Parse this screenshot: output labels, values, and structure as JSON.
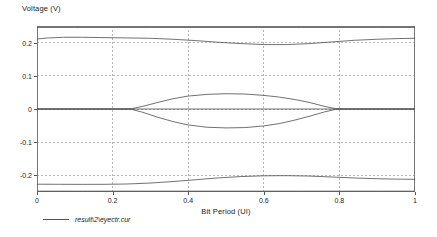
{
  "chart_data": {
    "type": "line",
    "title": "",
    "xlabel": "Bit Period (UI)",
    "ylabel": "Voltage (V)",
    "xlim": [
      0,
      1
    ],
    "ylim": [
      -0.25,
      0.25
    ],
    "x_ticks": [
      "0",
      "0.2",
      "0.4",
      "0.6",
      "0.8",
      "1"
    ],
    "x_tick_values": [
      0,
      0.2,
      0.4,
      0.6,
      0.8,
      1
    ],
    "y_ticks": [
      "0.2",
      "0.1",
      "0",
      "-0.1",
      "-0.2"
    ],
    "y_tick_values": [
      0.2,
      0.1,
      0,
      -0.1,
      -0.2
    ],
    "grid": true,
    "grid_style": "dashed",
    "grid_color": "#999999",
    "border_color": "#777777",
    "trace_color": "#4d4d4d",
    "legend_position": "below-left",
    "legend": [
      "result\\2\\eyectr.cur"
    ],
    "series": [
      {
        "name": "upper-rail-outer",
        "comment": "flat top envelope near +0.245 V",
        "points": [
          [
            0.0,
            0.2455
          ],
          [
            0.1,
            0.2455
          ],
          [
            0.2,
            0.2455
          ],
          [
            0.3,
            0.2455
          ],
          [
            0.4,
            0.2455
          ],
          [
            0.5,
            0.2455
          ],
          [
            0.6,
            0.2455
          ],
          [
            0.7,
            0.2455
          ],
          [
            0.8,
            0.2455
          ],
          [
            0.9,
            0.2455
          ],
          [
            1.0,
            0.2455
          ]
        ]
      },
      {
        "name": "upper-rail-inner",
        "comment": "high level trace dipping slightly below 0.2 mid-period",
        "points": [
          [
            0.0,
            0.211
          ],
          [
            0.03,
            0.214
          ],
          [
            0.07,
            0.216
          ],
          [
            0.12,
            0.216
          ],
          [
            0.18,
            0.215
          ],
          [
            0.24,
            0.214
          ],
          [
            0.3,
            0.213
          ],
          [
            0.36,
            0.21
          ],
          [
            0.42,
            0.206
          ],
          [
            0.48,
            0.201
          ],
          [
            0.54,
            0.197
          ],
          [
            0.6,
            0.194
          ],
          [
            0.66,
            0.194
          ],
          [
            0.72,
            0.197
          ],
          [
            0.78,
            0.202
          ],
          [
            0.84,
            0.207
          ],
          [
            0.9,
            0.21
          ],
          [
            0.95,
            0.212
          ],
          [
            1.0,
            0.213
          ]
        ]
      },
      {
        "name": "eye-upper-lobe",
        "comment": "upper edge of the open eye lens between the crossings",
        "points": [
          [
            0.0,
            0.0
          ],
          [
            0.1,
            0.0
          ],
          [
            0.2,
            0.0
          ],
          [
            0.25,
            0.001
          ],
          [
            0.28,
            0.008
          ],
          [
            0.32,
            0.02
          ],
          [
            0.36,
            0.031
          ],
          [
            0.4,
            0.039
          ],
          [
            0.45,
            0.044
          ],
          [
            0.5,
            0.046
          ],
          [
            0.55,
            0.045
          ],
          [
            0.6,
            0.041
          ],
          [
            0.64,
            0.036
          ],
          [
            0.68,
            0.029
          ],
          [
            0.72,
            0.02
          ],
          [
            0.76,
            0.008
          ],
          [
            0.79,
            0.001
          ],
          [
            0.84,
            0.0
          ],
          [
            0.92,
            0.0
          ],
          [
            1.0,
            0.0
          ]
        ]
      },
      {
        "name": "eye-lower-lobe",
        "comment": "lower edge of the open eye lens between the crossings",
        "points": [
          [
            0.0,
            0.0
          ],
          [
            0.1,
            0.0
          ],
          [
            0.2,
            0.0
          ],
          [
            0.25,
            -0.001
          ],
          [
            0.28,
            -0.01
          ],
          [
            0.32,
            -0.025
          ],
          [
            0.36,
            -0.038
          ],
          [
            0.4,
            -0.048
          ],
          [
            0.45,
            -0.055
          ],
          [
            0.5,
            -0.057
          ],
          [
            0.55,
            -0.056
          ],
          [
            0.6,
            -0.051
          ],
          [
            0.64,
            -0.044
          ],
          [
            0.68,
            -0.034
          ],
          [
            0.72,
            -0.022
          ],
          [
            0.76,
            -0.009
          ],
          [
            0.79,
            -0.001
          ],
          [
            0.84,
            0.0
          ],
          [
            0.92,
            0.0
          ],
          [
            1.0,
            0.0
          ]
        ]
      },
      {
        "name": "zero-baseline",
        "comment": "flat trace along 0 V",
        "points": [
          [
            0.0,
            0.0
          ],
          [
            0.25,
            0.0
          ],
          [
            0.5,
            0.0
          ],
          [
            0.75,
            0.0
          ],
          [
            1.0,
            0.0
          ]
        ]
      },
      {
        "name": "lower-rail-inner",
        "comment": "low level trace rising from about -0.225 toward -0.2",
        "points": [
          [
            0.0,
            -0.2265
          ],
          [
            0.06,
            -0.2268
          ],
          [
            0.12,
            -0.227
          ],
          [
            0.18,
            -0.2268
          ],
          [
            0.24,
            -0.2258
          ],
          [
            0.3,
            -0.223
          ],
          [
            0.36,
            -0.2185
          ],
          [
            0.42,
            -0.213
          ],
          [
            0.48,
            -0.2075
          ],
          [
            0.54,
            -0.2035
          ],
          [
            0.6,
            -0.2012
          ],
          [
            0.66,
            -0.2008
          ],
          [
            0.72,
            -0.202
          ],
          [
            0.78,
            -0.2048
          ],
          [
            0.84,
            -0.2078
          ],
          [
            0.9,
            -0.21
          ],
          [
            0.95,
            -0.2112
          ],
          [
            1.0,
            -0.2118
          ]
        ]
      },
      {
        "name": "lower-rail-outer",
        "comment": "flat bottom envelope near -0.2475 V",
        "points": [
          [
            0.0,
            -0.2475
          ],
          [
            0.1,
            -0.2475
          ],
          [
            0.2,
            -0.2475
          ],
          [
            0.3,
            -0.2475
          ],
          [
            0.4,
            -0.2475
          ],
          [
            0.5,
            -0.2475
          ],
          [
            0.6,
            -0.2475
          ],
          [
            0.7,
            -0.2475
          ],
          [
            0.8,
            -0.2475
          ],
          [
            0.9,
            -0.2475
          ],
          [
            1.0,
            -0.2475
          ]
        ]
      }
    ]
  }
}
